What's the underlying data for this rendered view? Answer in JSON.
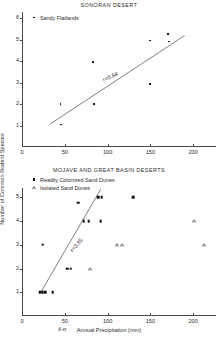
{
  "figure": {
    "ylabel": "Number of Common Rodent Species",
    "xlabel": "Annual  Precipitation (mm)",
    "xmean_marker": "x̄-σ"
  },
  "chart_data": [
    {
      "type": "scatter",
      "title": "SONORAN DESERT",
      "xlabel": "Annual  Precipitation (mm)",
      "ylabel": "Number of Common Rodent Species",
      "xlim": [
        0,
        215
      ],
      "ylim": [
        0,
        6.3
      ],
      "xticks": [
        0,
        50,
        100,
        150,
        200
      ],
      "xticklabels": [
        "0",
        "50",
        "100",
        "150",
        "200"
      ],
      "yticks": [
        1,
        2,
        3,
        4,
        5,
        6
      ],
      "yticklabels": [
        "1",
        "2",
        "3",
        "4",
        "5",
        "6"
      ],
      "grid": false,
      "legend_position": "top-left",
      "annotations": [
        {
          "text": "r=0.84",
          "x": 95,
          "y": 3.25,
          "rotation": -24
        }
      ],
      "fit_line": {
        "x0": 32,
        "y0": 1.05,
        "x1": 190,
        "y1": 5.2,
        "r": 0.84
      },
      "series": [
        {
          "name": "Sandy Flatlands",
          "marker": "dot",
          "points": [
            {
              "x": 45,
              "y": 2.0
            },
            {
              "x": 46,
              "y": 1.05
            },
            {
              "x": 83,
              "y": 3.97
            },
            {
              "x": 84,
              "y": 2.0
            },
            {
              "x": 150,
              "y": 4.97
            },
            {
              "x": 150,
              "y": 2.95
            },
            {
              "x": 171,
              "y": 5.27
            },
            {
              "x": 172,
              "y": 4.92
            }
          ]
        }
      ]
    },
    {
      "type": "scatter",
      "title": "MOJAVE AND GREAT BASIN DESERTS",
      "xlabel": "Annual  Precipitation (mm)",
      "ylabel": "Number of Common Rodent Species",
      "xlim": [
        0,
        215
      ],
      "ylim": [
        0,
        5.4
      ],
      "xticks": [
        0,
        50,
        100,
        150,
        200
      ],
      "xticklabels": [
        "0",
        "50",
        "100",
        "150",
        "200"
      ],
      "yticks": [
        1,
        2,
        3,
        4,
        5
      ],
      "yticklabels": [
        "1",
        "2",
        "3",
        "4",
        "5"
      ],
      "grid": false,
      "legend_position": "top-left",
      "annotations": [
        {
          "text": "r=0.85",
          "x": 57,
          "y": 2.85,
          "rotation": -48
        }
      ],
      "fit_line": {
        "x0": 22,
        "y0": 1.0,
        "x1": 92,
        "y1": 5.35,
        "r": 0.85
      },
      "series": [
        {
          "name": "Readily Colonized Sand Dunes",
          "marker": "square",
          "points": [
            {
              "x": 21,
              "y": 1.0
            },
            {
              "x": 24,
              "y": 1.0
            },
            {
              "x": 27,
              "y": 1.0
            },
            {
              "x": 36,
              "y": 1.0
            },
            {
              "x": 24,
              "y": 3.0
            },
            {
              "x": 53,
              "y": 2.0
            },
            {
              "x": 57,
              "y": 2.0
            },
            {
              "x": 66,
              "y": 4.78
            },
            {
              "x": 72,
              "y": 4.0
            },
            {
              "x": 78,
              "y": 4.0
            },
            {
              "x": 89,
              "y": 5.0
            },
            {
              "x": 93,
              "y": 5.0
            },
            {
              "x": 92,
              "y": 4.0
            },
            {
              "x": 130,
              "y": 5.0
            }
          ]
        },
        {
          "name": "Isolated Sand Dunes",
          "marker": "triangle",
          "points": [
            {
              "x": 80,
              "y": 2.0
            },
            {
              "x": 111,
              "y": 3.0
            },
            {
              "x": 117,
              "y": 3.0
            },
            {
              "x": 201,
              "y": 4.0
            },
            {
              "x": 213,
              "y": 3.0
            }
          ]
        }
      ]
    }
  ]
}
